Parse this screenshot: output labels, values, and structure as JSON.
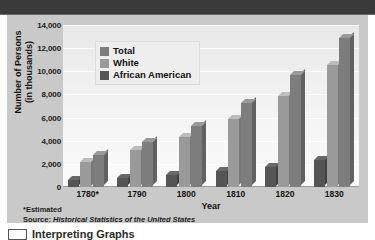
{
  "window": {
    "title_band_text": ""
  },
  "chart_data": {
    "type": "bar",
    "title": "",
    "xlabel": "Year",
    "ylabel": "Number of Persons (in thousands)",
    "ylabel_line1": "Number of Persons",
    "ylabel_line2": "(in thousands)",
    "categories": [
      "1780*",
      "1790",
      "1800",
      "1810",
      "1820",
      "1830"
    ],
    "yticks": [
      "0",
      "2,000",
      "4,000",
      "6,000",
      "8,000",
      "10,000",
      "12,000",
      "14,000"
    ],
    "ytick_values": [
      0,
      2000,
      4000,
      6000,
      8000,
      10000,
      12000,
      14000
    ],
    "ylim": [
      0,
      14000
    ],
    "grid": true,
    "legend_position": "upper-left-inside",
    "series": [
      {
        "name": "African American",
        "color": "#555555",
        "values": [
          575,
          760,
          1002,
          1378,
          1772,
          2329
        ]
      },
      {
        "name": "White",
        "color": "#9a9a9a",
        "values": [
          2204,
          3172,
          4306,
          5862,
          7867,
          10537
        ]
      },
      {
        "name": "Total",
        "color": "#7d7d7d",
        "values": [
          2780,
          3929,
          5308,
          7240,
          9638,
          12866
        ]
      }
    ],
    "series_draw_order": [
      "African American",
      "White",
      "Total"
    ],
    "legend_entries": [
      {
        "label": "Total",
        "color": "#7d7d7d"
      },
      {
        "label": "White",
        "color": "#9a9a9a"
      },
      {
        "label": "African American",
        "color": "#555555"
      }
    ],
    "notes": [
      "*Estimated",
      "Source: Historical Statistics of the United States"
    ],
    "source_prefix": "Source: ",
    "source_italic": "Historical Statistics of the United States",
    "estimated_note": "*Estimated"
  },
  "colors": {
    "panel_background": "#c9c9c9",
    "plot_background": "#f2f2f2",
    "gridline": "#ffffff",
    "title_band": "#3a3a3a",
    "text": "#111111",
    "total": "#7d7d7d",
    "white_series": "#9a9a9a",
    "african_american": "#555555"
  },
  "caption": {
    "text": "Interpreting Graphs",
    "icon": "graph-thumbnail-icon"
  }
}
